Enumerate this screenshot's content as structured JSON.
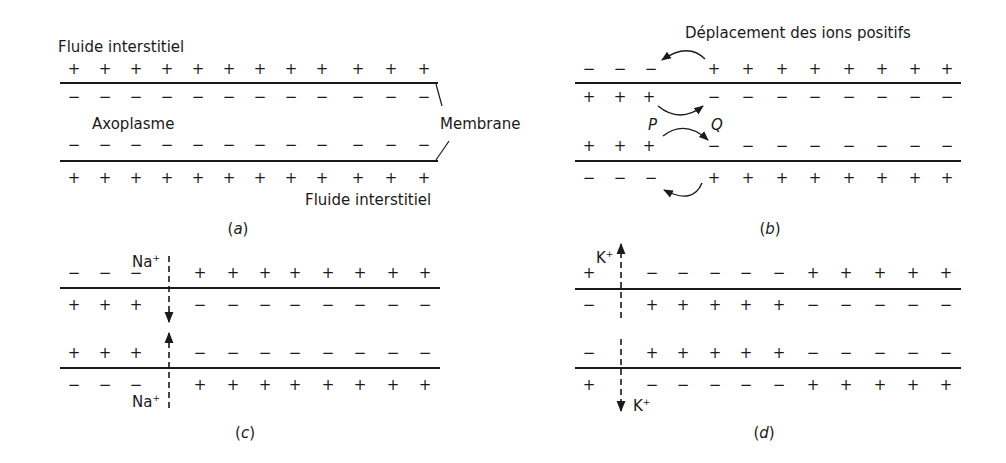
{
  "figure": {
    "panels": [
      {
        "id": "a",
        "caption": "a",
        "caption_pos": [
          238,
          222
        ],
        "membrane_lines": {
          "x1": 60,
          "x2": 438,
          "top_y": 83,
          "bottom_y": 161
        },
        "rows": [
          {
            "y": 70,
            "charges": [
              [
                74,
                "+"
              ],
              [
                105,
                "+"
              ],
              [
                136,
                "+"
              ],
              [
                167,
                "+"
              ],
              [
                198,
                "+"
              ],
              [
                229,
                "+"
              ],
              [
                260,
                "+"
              ],
              [
                291,
                "+"
              ],
              [
                322,
                "+"
              ],
              [
                358,
                "+"
              ],
              [
                391,
                "+"
              ],
              [
                424,
                "+"
              ]
            ]
          },
          {
            "y": 98,
            "charges": [
              [
                74,
                "−"
              ],
              [
                105,
                "−"
              ],
              [
                136,
                "−"
              ],
              [
                167,
                "−"
              ],
              [
                198,
                "−"
              ],
              [
                229,
                "−"
              ],
              [
                260,
                "−"
              ],
              [
                291,
                "−"
              ],
              [
                322,
                "−"
              ],
              [
                358,
                "−"
              ],
              [
                391,
                "−"
              ],
              [
                424,
                "−"
              ]
            ]
          },
          {
            "y": 146,
            "charges": [
              [
                74,
                "−"
              ],
              [
                105,
                "−"
              ],
              [
                136,
                "−"
              ],
              [
                167,
                "−"
              ],
              [
                198,
                "−"
              ],
              [
                229,
                "−"
              ],
              [
                260,
                "−"
              ],
              [
                291,
                "−"
              ],
              [
                322,
                "−"
              ],
              [
                358,
                "−"
              ],
              [
                391,
                "−"
              ],
              [
                424,
                "−"
              ]
            ]
          },
          {
            "y": 179,
            "charges": [
              [
                74,
                "+"
              ],
              [
                105,
                "+"
              ],
              [
                136,
                "+"
              ],
              [
                167,
                "+"
              ],
              [
                198,
                "+"
              ],
              [
                229,
                "+"
              ],
              [
                260,
                "+"
              ],
              [
                291,
                "+"
              ],
              [
                322,
                "+"
              ],
              [
                358,
                "+"
              ],
              [
                391,
                "+"
              ],
              [
                424,
                "+"
              ]
            ]
          }
        ],
        "labels": [
          {
            "text": "Fluide interstitiel",
            "x": 58,
            "y": 40,
            "name": "label-fluide-interstitiel-top"
          },
          {
            "text": "Axoplasme",
            "x": 92,
            "y": 117,
            "name": "label-axoplasme"
          },
          {
            "text": "Membrane",
            "x": 440,
            "y": 117,
            "name": "label-membrane"
          },
          {
            "text": "Fluide interstitiel",
            "x": 305,
            "y": 193,
            "name": "label-fluide-interstitiel-bottom"
          }
        ],
        "leaders": [
          [
            436,
            84,
            442,
            106
          ],
          [
            436,
            160,
            449,
            141
          ]
        ]
      },
      {
        "id": "b",
        "caption": "b",
        "caption_pos": [
          770,
          222
        ],
        "membrane_lines": {
          "x1": 575,
          "x2": 961,
          "top_y": 83,
          "bottom_y": 161
        },
        "rows": [
          {
            "y": 70,
            "charges": [
              [
                589,
                "−"
              ],
              [
                620,
                "−"
              ],
              [
                651,
                "−"
              ],
              [
                714,
                "+"
              ],
              [
                748,
                "+"
              ],
              [
                782,
                "+"
              ],
              [
                815,
                "+"
              ],
              [
                849,
                "+"
              ],
              [
                882,
                "+"
              ],
              [
                915,
                "+"
              ],
              [
                947,
                "+"
              ]
            ]
          },
          {
            "y": 98,
            "charges": [
              [
                589,
                "+"
              ],
              [
                620,
                "+"
              ],
              [
                649,
                "+"
              ],
              [
                714,
                "−"
              ],
              [
                748,
                "−"
              ],
              [
                782,
                "−"
              ],
              [
                815,
                "−"
              ],
              [
                849,
                "−"
              ],
              [
                882,
                "−"
              ],
              [
                915,
                "−"
              ],
              [
                947,
                "−"
              ]
            ]
          },
          {
            "y": 147,
            "charges": [
              [
                589,
                "+"
              ],
              [
                620,
                "+"
              ],
              [
                649,
                "+"
              ],
              [
                714,
                "−"
              ],
              [
                748,
                "−"
              ],
              [
                782,
                "−"
              ],
              [
                815,
                "−"
              ],
              [
                849,
                "−"
              ],
              [
                882,
                "−"
              ],
              [
                915,
                "−"
              ],
              [
                947,
                "−"
              ]
            ]
          },
          {
            "y": 179,
            "charges": [
              [
                589,
                "−"
              ],
              [
                620,
                "−"
              ],
              [
                651,
                "−"
              ],
              [
                714,
                "+"
              ],
              [
                748,
                "+"
              ],
              [
                782,
                "+"
              ],
              [
                815,
                "+"
              ],
              [
                849,
                "+"
              ],
              [
                882,
                "+"
              ],
              [
                915,
                "+"
              ],
              [
                947,
                "+"
              ]
            ]
          }
        ],
        "labels": [
          {
            "text": "Déplacement des ions positifs",
            "x": 685,
            "y": 26,
            "name": "label-deplacement-ions-positifs"
          }
        ],
        "italic_labels": [
          {
            "text": "P",
            "x": 648,
            "y": 118,
            "name": "label-point-p"
          },
          {
            "text": "Q",
            "x": 711,
            "y": 118,
            "name": "label-point-q"
          }
        ],
        "curved_arrows": [
          {
            "d": "M 705 59 Q 688 42 662 60",
            "name": "arrow-outer-top"
          },
          {
            "d": "M 658 106 Q 680 124 703 106",
            "name": "arrow-inner-top"
          },
          {
            "d": "M 663 136 Q 685 119 708 140",
            "name": "arrow-inner-bottom"
          },
          {
            "d": "M 702 183 Q 693 205 664 190",
            "name": "arrow-outer-bottom"
          }
        ]
      },
      {
        "id": "c",
        "caption": "c",
        "caption_pos": [
          245,
          426
        ],
        "membrane_lines": {
          "x1": 60,
          "x2": 440,
          "top_y": 288,
          "bottom_y": 368
        },
        "rows": [
          {
            "y": 274,
            "charges": [
              [
                74,
                "−"
              ],
              [
                105,
                "−"
              ],
              [
                136,
                "−"
              ],
              [
                200,
                "+"
              ],
              [
                233,
                "+"
              ],
              [
                265,
                "+"
              ],
              [
                295,
                "+"
              ],
              [
                328,
                "+"
              ],
              [
                360,
                "+"
              ],
              [
                393,
                "+"
              ],
              [
                425,
                "+"
              ]
            ]
          },
          {
            "y": 306,
            "charges": [
              [
                74,
                "+"
              ],
              [
                105,
                "+"
              ],
              [
                136,
                "+"
              ],
              [
                200,
                "−"
              ],
              [
                233,
                "−"
              ],
              [
                265,
                "−"
              ],
              [
                295,
                "−"
              ],
              [
                328,
                "−"
              ],
              [
                360,
                "−"
              ],
              [
                393,
                "−"
              ],
              [
                425,
                "−"
              ]
            ]
          },
          {
            "y": 354,
            "charges": [
              [
                74,
                "+"
              ],
              [
                105,
                "+"
              ],
              [
                136,
                "+"
              ],
              [
                200,
                "−"
              ],
              [
                233,
                "−"
              ],
              [
                265,
                "−"
              ],
              [
                295,
                "−"
              ],
              [
                328,
                "−"
              ],
              [
                360,
                "−"
              ],
              [
                393,
                "−"
              ],
              [
                425,
                "−"
              ]
            ]
          },
          {
            "y": 386,
            "charges": [
              [
                74,
                "−"
              ],
              [
                105,
                "−"
              ],
              [
                136,
                "−"
              ],
              [
                200,
                "+"
              ],
              [
                233,
                "+"
              ],
              [
                265,
                "+"
              ],
              [
                295,
                "+"
              ],
              [
                328,
                "+"
              ],
              [
                360,
                "+"
              ],
              [
                393,
                "+"
              ],
              [
                425,
                "+"
              ]
            ]
          }
        ],
        "ions": [
          {
            "symbol": "Na",
            "charge": "+",
            "x": 132,
            "y": 254,
            "name": "label-na-ion-top"
          },
          {
            "symbol": "Na",
            "charge": "+",
            "x": 132,
            "y": 394,
            "name": "label-na-ion-bottom"
          }
        ],
        "dashed_arrows": [
          {
            "x": 169,
            "y1": 256,
            "y2": 322,
            "dir": "down",
            "name": "na-influx-arrow-top"
          },
          {
            "x": 169,
            "y1": 408,
            "y2": 333,
            "dir": "up",
            "name": "na-influx-arrow-bottom"
          }
        ]
      },
      {
        "id": "d",
        "caption": "d",
        "caption_pos": [
          764,
          426
        ],
        "membrane_lines": {
          "x1": 575,
          "x2": 961,
          "top_y": 289,
          "bottom_y": 368
        },
        "rows": [
          {
            "y": 274,
            "charges": [
              [
                589,
                "+"
              ],
              [
                652,
                "−"
              ],
              [
                683,
                "−"
              ],
              [
                715,
                "−"
              ],
              [
                746,
                "−"
              ],
              [
                779,
                "−"
              ],
              [
                813,
                "+"
              ],
              [
                846,
                "+"
              ],
              [
                880,
                "+"
              ],
              [
                913,
                "+"
              ],
              [
                946,
                "+"
              ]
            ]
          },
          {
            "y": 306,
            "charges": [
              [
                589,
                "−"
              ],
              [
                652,
                "+"
              ],
              [
                683,
                "+"
              ],
              [
                715,
                "+"
              ],
              [
                746,
                "+"
              ],
              [
                779,
                "+"
              ],
              [
                813,
                "−"
              ],
              [
                846,
                "−"
              ],
              [
                880,
                "−"
              ],
              [
                913,
                "−"
              ],
              [
                946,
                "−"
              ]
            ]
          },
          {
            "y": 354,
            "charges": [
              [
                589,
                "−"
              ],
              [
                652,
                "+"
              ],
              [
                683,
                "+"
              ],
              [
                715,
                "+"
              ],
              [
                746,
                "+"
              ],
              [
                779,
                "+"
              ],
              [
                813,
                "−"
              ],
              [
                846,
                "−"
              ],
              [
                880,
                "−"
              ],
              [
                913,
                "−"
              ],
              [
                946,
                "−"
              ]
            ]
          },
          {
            "y": 386,
            "charges": [
              [
                589,
                "+"
              ],
              [
                652,
                "−"
              ],
              [
                683,
                "−"
              ],
              [
                715,
                "−"
              ],
              [
                746,
                "−"
              ],
              [
                779,
                "−"
              ],
              [
                813,
                "+"
              ],
              [
                846,
                "+"
              ],
              [
                880,
                "+"
              ],
              [
                913,
                "+"
              ],
              [
                946,
                "+"
              ]
            ]
          }
        ],
        "ions": [
          {
            "symbol": "K",
            "charge": "+",
            "x": 596,
            "y": 250,
            "name": "label-k-ion-top"
          },
          {
            "symbol": "K",
            "charge": "+",
            "x": 633,
            "y": 398,
            "name": "label-k-ion-bottom"
          }
        ],
        "dashed_arrows": [
          {
            "x": 621,
            "y1": 318,
            "y2": 244,
            "dir": "up",
            "name": "k-efflux-arrow-top"
          },
          {
            "x": 621,
            "y1": 339,
            "y2": 411,
            "dir": "down",
            "name": "k-efflux-arrow-bottom"
          }
        ]
      }
    ],
    "colors": {
      "ink": "#1a1a1a",
      "background": "#ffffff"
    }
  }
}
